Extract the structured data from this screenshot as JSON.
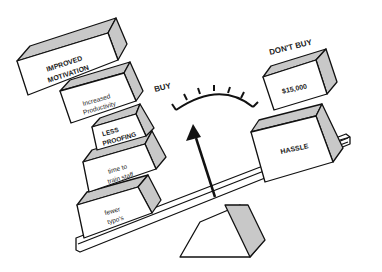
{
  "illustration": {
    "type": "balance-scale-decision",
    "side_labels": {
      "buy": "BUY",
      "dont_buy": "DON'T BUY"
    },
    "buy_blocks": [
      {
        "line1": "IMPROVED",
        "line2": "MOTIVATION"
      },
      {
        "line1": "Increased",
        "line2": "Productivity"
      },
      {
        "line1": "LESS",
        "line2": "PROOFING"
      },
      {
        "line1": "time to",
        "line2": "train staff"
      },
      {
        "line1": "fewer",
        "line2": "typo's"
      }
    ],
    "dont_buy_blocks": [
      {
        "line1": "$15,000"
      },
      {
        "line1": "HASSLE"
      }
    ],
    "gauge": {
      "tick_count": 7,
      "needle_direction": "up-left"
    },
    "colors": {
      "line": "#111111",
      "shade": "#c8c8c8",
      "background": "#ffffff"
    }
  }
}
